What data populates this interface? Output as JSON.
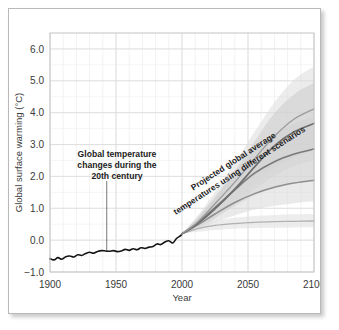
{
  "figure": {
    "frame_color": "#b9b9b9",
    "background": "#ffffff"
  },
  "chart_data": {
    "type": "line",
    "title": "",
    "xlabel": "Year",
    "ylabel": "Global surface warming (°C)",
    "xlim": [
      1900,
      2100
    ],
    "ylim": [
      -1.0,
      6.5
    ],
    "xticks": [
      1900,
      1950,
      2000,
      2050,
      2100
    ],
    "xticklabels": [
      "1900",
      "1950",
      "2000",
      "2050",
      "2100"
    ],
    "yticks": [
      -1.0,
      0.0,
      1.0,
      2.0,
      3.0,
      4.0,
      5.0,
      6.0
    ],
    "yticklabels": [
      "-1.0",
      "0.0",
      "1.0",
      "2.0",
      "3.0",
      "4.0",
      "5.0",
      "6.0"
    ],
    "grid": true,
    "grid_minor_x_step": 10,
    "grid_minor_y_step": 0.5,
    "legend": "none",
    "annotations": [
      {
        "name": "historical-annotation",
        "text_lines": [
          "Global temperature",
          "changes during the",
          "20th century"
        ],
        "rotation": 0,
        "anchor_year": 1943,
        "anchor_value": -0.35
      },
      {
        "name": "projection-annotation",
        "text_lines": [
          "Projected global average",
          "temperatures using different scenarios"
        ],
        "rotation": -33,
        "anchor_year": 2040,
        "anchor_value": 2.4
      }
    ],
    "series": [
      {
        "name": "Observed global surface temperature",
        "kind": "historical",
        "color": "#141414",
        "width": 1.6,
        "x": [
          1900,
          1903,
          1906,
          1909,
          1912,
          1915,
          1918,
          1921,
          1924,
          1927,
          1930,
          1933,
          1936,
          1939,
          1942,
          1945,
          1948,
          1951,
          1954,
          1957,
          1960,
          1963,
          1966,
          1969,
          1972,
          1975,
          1978,
          1981,
          1984,
          1987,
          1990,
          1993,
          1996,
          1999,
          2000
        ],
        "values": [
          -0.58,
          -0.62,
          -0.55,
          -0.6,
          -0.52,
          -0.5,
          -0.53,
          -0.46,
          -0.48,
          -0.42,
          -0.38,
          -0.41,
          -0.36,
          -0.33,
          -0.34,
          -0.35,
          -0.33,
          -0.36,
          -0.34,
          -0.29,
          -0.32,
          -0.27,
          -0.3,
          -0.24,
          -0.26,
          -0.22,
          -0.2,
          -0.12,
          -0.14,
          -0.06,
          -0.02,
          -0.09,
          0.06,
          0.14,
          0.2
        ]
      },
      {
        "name": "Constant year-2000 concentrations",
        "kind": "projection",
        "color": "#b0b0b0",
        "width": 1.3,
        "x": [
          2000,
          2012,
          2025,
          2040,
          2055,
          2070,
          2085,
          2100
        ],
        "values": [
          0.2,
          0.36,
          0.46,
          0.52,
          0.56,
          0.58,
          0.59,
          0.6
        ],
        "band_color": "#dedede",
        "band_low": [
          0.2,
          0.26,
          0.32,
          0.36,
          0.38,
          0.39,
          0.4,
          0.4
        ],
        "band_high": [
          0.2,
          0.46,
          0.6,
          0.7,
          0.76,
          0.79,
          0.81,
          0.82
        ]
      },
      {
        "name": "Scenario B1",
        "kind": "projection",
        "color": "#8e8e8e",
        "width": 1.5,
        "x": [
          2000,
          2012,
          2025,
          2040,
          2055,
          2070,
          2085,
          2100
        ],
        "values": [
          0.2,
          0.48,
          0.82,
          1.18,
          1.46,
          1.66,
          1.79,
          1.88
        ],
        "band_color": "#d8d8d8",
        "band_low": [
          0.2,
          0.34,
          0.56,
          0.78,
          0.96,
          1.08,
          1.16,
          1.22
        ],
        "band_high": [
          0.2,
          0.64,
          1.12,
          1.62,
          2.02,
          2.3,
          2.48,
          2.6
        ]
      },
      {
        "name": "Scenario A1B",
        "kind": "projection",
        "color": "#7a7a7a",
        "width": 1.6,
        "x": [
          2000,
          2012,
          2025,
          2040,
          2055,
          2070,
          2085,
          2100
        ],
        "values": [
          0.2,
          0.54,
          1.02,
          1.58,
          2.1,
          2.46,
          2.7,
          2.86
        ],
        "band_color": "#d2d2d2",
        "band_low": [
          0.2,
          0.38,
          0.7,
          1.06,
          1.4,
          1.64,
          1.8,
          1.9
        ],
        "band_high": [
          0.2,
          0.72,
          1.38,
          2.14,
          2.84,
          3.34,
          3.66,
          3.88
        ]
      },
      {
        "name": "Scenario A2",
        "kind": "projection",
        "color": "#6e6e6e",
        "width": 1.7,
        "x": [
          2000,
          2012,
          2025,
          2040,
          2055,
          2070,
          2085,
          2100
        ],
        "values": [
          0.2,
          0.52,
          0.98,
          1.6,
          2.3,
          2.96,
          3.4,
          3.66
        ],
        "band_color": "#cccccc",
        "band_low": [
          0.2,
          0.36,
          0.68,
          1.1,
          1.58,
          2.02,
          2.32,
          2.5
        ],
        "band_high": [
          0.2,
          0.7,
          1.32,
          2.16,
          3.1,
          3.98,
          4.58,
          4.94
        ]
      },
      {
        "name": "Upper scenario envelope",
        "kind": "projection",
        "color": "#9a9a9a",
        "width": 1.3,
        "x": [
          2000,
          2012,
          2025,
          2040,
          2055,
          2070,
          2085,
          2100
        ],
        "values": [
          0.2,
          0.58,
          1.14,
          1.82,
          2.56,
          3.26,
          3.8,
          4.12
        ],
        "band_color": "#dcdcdc",
        "band_low": [
          0.2,
          0.42,
          0.8,
          1.26,
          1.76,
          2.24,
          2.6,
          2.82
        ],
        "band_high": [
          0.2,
          0.78,
          1.52,
          2.42,
          3.4,
          4.32,
          5.04,
          5.46
        ]
      }
    ]
  }
}
